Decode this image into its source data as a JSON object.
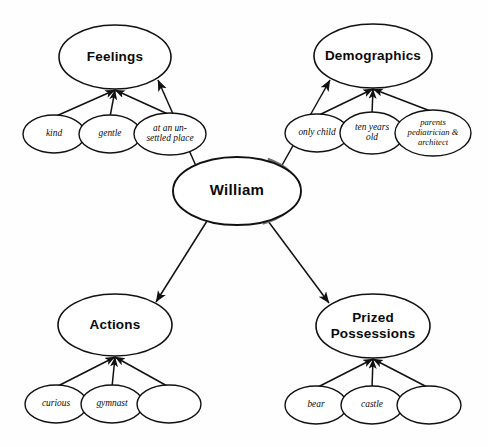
{
  "diagram": {
    "type": "concept-map",
    "title_node": "William",
    "colors": {
      "background": "#fefefe",
      "stroke": "#111111",
      "shadow": "#6e6e6e",
      "text": "#0a0a0a"
    },
    "center": {
      "label": "William",
      "cx": 237,
      "cy": 191,
      "rx": 64,
      "ry": 34
    },
    "categories": [
      {
        "id": "feelings",
        "label": "Feelings",
        "cx": 115,
        "cy": 57,
        "rx": 56,
        "ry": 32,
        "children": [
          {
            "id": "kind",
            "label": "kind",
            "lines": [
              "kind"
            ],
            "cx": 54,
            "cy": 134,
            "rx": 31,
            "ry": 19
          },
          {
            "id": "gentle",
            "label": "gentle",
            "lines": [
              "gentle"
            ],
            "cx": 110,
            "cy": 134,
            "rx": 31,
            "ry": 19
          },
          {
            "id": "unsettled-place",
            "label": "at an un-settled place",
            "lines": [
              "at an un-",
              "settled place"
            ],
            "cx": 170,
            "cy": 134,
            "rx": 36,
            "ry": 21
          }
        ]
      },
      {
        "id": "demographics",
        "label": "Demographics",
        "cx": 373,
        "cy": 56,
        "rx": 59,
        "ry": 32,
        "children": [
          {
            "id": "only-child",
            "label": "only child",
            "lines": [
              "only child"
            ],
            "cx": 317,
            "cy": 133,
            "rx": 32,
            "ry": 19
          },
          {
            "id": "ten-years-old",
            "label": "ten years old",
            "lines": [
              "ten years",
              "old"
            ],
            "cx": 372,
            "cy": 133,
            "rx": 32,
            "ry": 21
          },
          {
            "id": "parents-jobs",
            "label": "parents pediatrician & architect",
            "lines": [
              "parents",
              "pediatrician &",
              "architect"
            ],
            "cx": 433,
            "cy": 133,
            "rx": 38,
            "ry": 23
          }
        ]
      },
      {
        "id": "actions",
        "label": "Actions",
        "cx": 115,
        "cy": 325,
        "rx": 57,
        "ry": 31,
        "children": [
          {
            "id": "curious",
            "label": "curious",
            "lines": [
              "curious"
            ],
            "cx": 56,
            "cy": 404,
            "rx": 31,
            "ry": 19
          },
          {
            "id": "gymnast",
            "label": "gymnast",
            "lines": [
              "gymnast"
            ],
            "cx": 112,
            "cy": 404,
            "rx": 31,
            "ry": 19
          },
          {
            "id": "actions-blank",
            "label": "",
            "lines": [],
            "cx": 169,
            "cy": 404,
            "rx": 32,
            "ry": 19
          }
        ]
      },
      {
        "id": "prized-possessions",
        "label": "Prized Possessions",
        "lines": [
          "Prized",
          "Possessions"
        ],
        "cx": 373,
        "cy": 326,
        "rx": 57,
        "ry": 32,
        "children": [
          {
            "id": "bear",
            "label": "bear",
            "lines": [
              "bear"
            ],
            "cx": 316,
            "cy": 405,
            "rx": 31,
            "ry": 19
          },
          {
            "id": "castle",
            "label": "castle",
            "lines": [
              "castle"
            ],
            "cx": 372,
            "cy": 405,
            "rx": 31,
            "ry": 19
          },
          {
            "id": "possessions-blank",
            "label": "",
            "lines": [],
            "cx": 429,
            "cy": 405,
            "rx": 32,
            "ry": 19
          }
        ]
      }
    ],
    "main_links": [
      {
        "id": "william-to-feelings",
        "from": "William",
        "to": "Feelings",
        "x1": 196,
        "y1": 166,
        "x2": 158,
        "y2": 80
      },
      {
        "id": "william-to-demographics",
        "from": "William",
        "to": "Demographics",
        "x1": 281,
        "y1": 167,
        "x2": 330,
        "y2": 80
      },
      {
        "id": "william-to-actions",
        "from": "William",
        "to": "Actions",
        "x1": 207,
        "y1": 221,
        "x2": 156,
        "y2": 302
      },
      {
        "id": "william-to-prized-possessions",
        "from": "William",
        "to": "Prized Possessions",
        "x1": 268,
        "y1": 221,
        "x2": 329,
        "y2": 303
      }
    ]
  }
}
